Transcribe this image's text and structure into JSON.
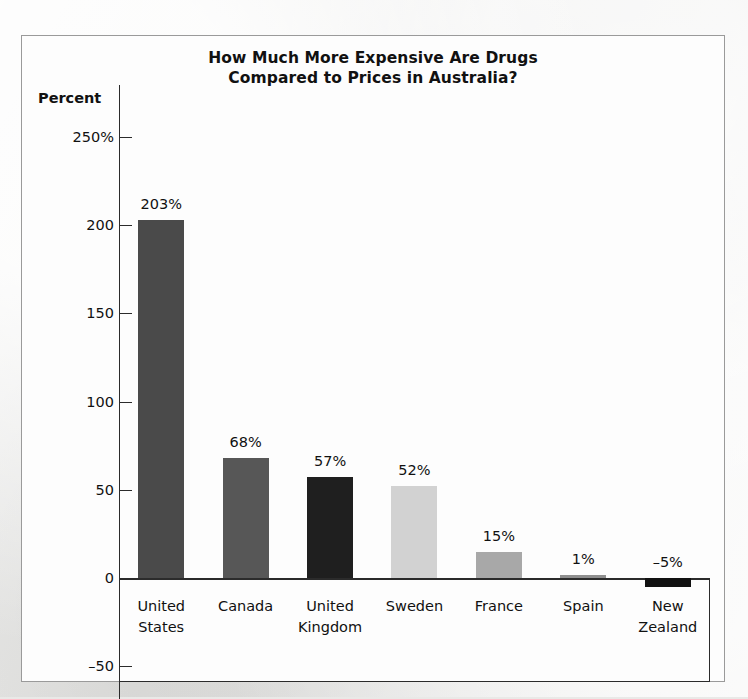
{
  "chart_data": {
    "type": "bar",
    "title": "How Much More Expensive Are Drugs Compared to Prices in Australia?",
    "title_lines": [
      "How Much More Expensive Are Drugs",
      "Compared to Prices in Australia?"
    ],
    "xlabel": "",
    "ylabel": "Percent",
    "ylim": [
      -50,
      250
    ],
    "yticks": [
      250,
      200,
      150,
      100,
      50,
      0,
      -50
    ],
    "ytick_labels": [
      "250%",
      "200",
      "150",
      "100",
      "50",
      "0",
      "-50"
    ],
    "grid": false,
    "legend": "none",
    "categories": [
      "United States",
      "Canada",
      "United Kingdom",
      "Sweden",
      "France",
      "Spain",
      "New Zealand"
    ],
    "category_lines": [
      [
        "United",
        "States"
      ],
      [
        "Canada"
      ],
      [
        "United",
        "Kingdom"
      ],
      [
        "Sweden"
      ],
      [
        "France"
      ],
      [
        "Spain"
      ],
      [
        "New",
        "Zealand"
      ]
    ],
    "values": [
      203,
      68,
      57,
      52,
      15,
      1,
      -5
    ],
    "value_labels": [
      "203%",
      "68%",
      "57%",
      "52%",
      "15%",
      "1%",
      "-5%"
    ],
    "bar_colors": [
      "#4a4a4a",
      "#575757",
      "#1f1f1f",
      "#d2d2d2",
      "#a8a8a8",
      "#8f8f8f",
      "#111111"
    ]
  },
  "colors": {
    "page_background": "#e8e8e6",
    "panel_background": "#fdfdfd",
    "frame_border": "#9a9a9a",
    "axis": "#2b2b2b",
    "text": "#111111"
  }
}
